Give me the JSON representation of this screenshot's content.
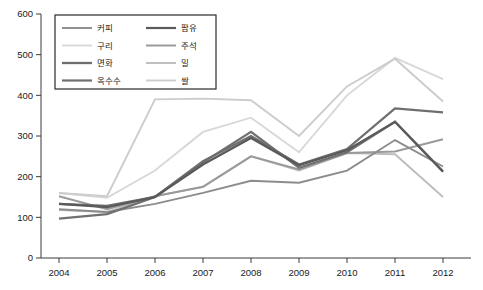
{
  "chart_data": {
    "type": "line",
    "title": "",
    "subtitle": "",
    "xlabel": "",
    "ylabel": "",
    "categories": [
      "2004",
      "2005",
      "2006",
      "2007",
      "2008",
      "2009",
      "2010",
      "2011",
      "2012"
    ],
    "x": [
      2004,
      2005,
      2006,
      2007,
      2008,
      2009,
      2010,
      2011,
      2012
    ],
    "ylim": [
      0,
      600
    ],
    "ytick_values": [
      0,
      100,
      200,
      300,
      400,
      500,
      600
    ],
    "ytick_labels": [
      "0",
      "100",
      "200",
      "300",
      "400",
      "500",
      "600"
    ],
    "xtick_labels": [
      "2004",
      "2005",
      "2006",
      "2007",
      "2008",
      "2009",
      "2010",
      "2011",
      "2012"
    ],
    "grid": false,
    "legend_position": "top-left",
    "series": [
      {
        "name": "커피",
        "color": "#8c8c8c",
        "width": 1.9,
        "values": [
          120,
          113,
          133,
          160,
          190,
          185,
          215,
          290,
          225
        ]
      },
      {
        "name": "구리",
        "color": "#d8d8d8",
        "width": 1.9,
        "values": [
          160,
          148,
          215,
          310,
          345,
          260,
          400,
          492,
          440
        ]
      },
      {
        "name": "면화",
        "color": "#6e6e6e",
        "width": 2.3,
        "values": [
          133,
          128,
          150,
          238,
          300,
          230,
          268,
          368,
          358
        ]
      },
      {
        "name": "옥수수",
        "color": "#707070",
        "width": 2.2,
        "values": [
          97,
          108,
          150,
          235,
          310,
          222,
          260,
          335,
          213
        ]
      },
      {
        "name": "팜유",
        "color": "#5a5a5a",
        "width": 2.2,
        "values": [
          133,
          125,
          150,
          230,
          295,
          228,
          265,
          335,
          212
        ]
      },
      {
        "name": "주석",
        "color": "#9a9a9a",
        "width": 2.0,
        "values": [
          152,
          120,
          152,
          175,
          250,
          218,
          258,
          262,
          292
        ]
      },
      {
        "name": "밀",
        "color": "#bdbdbd",
        "width": 1.9,
        "values": [
          118,
          113,
          152,
          175,
          250,
          215,
          258,
          255,
          150
        ]
      },
      {
        "name": "쌀",
        "color": "#cccccc",
        "width": 1.9,
        "values": [
          160,
          152,
          390,
          392,
          388,
          300,
          422,
          490,
          385
        ]
      }
    ]
  },
  "legend": {
    "entries": [
      {
        "label": "커피"
      },
      {
        "label": "팜유"
      },
      {
        "label": "구리"
      },
      {
        "label": "주석"
      },
      {
        "label": "면화"
      },
      {
        "label": "밀"
      },
      {
        "label": "옥수수"
      },
      {
        "label": "쌀"
      }
    ]
  },
  "axes": {
    "y_labels": [
      "600",
      "500",
      "400",
      "300",
      "200",
      "100",
      "0"
    ],
    "x_labels": [
      "2004",
      "2005",
      "2006",
      "2007",
      "2008",
      "2009",
      "2010",
      "2011",
      "2012"
    ]
  },
  "colors": {
    "axis": "#3a3a3a",
    "background": "#ffffff",
    "legend_border": "#2b2b2b"
  }
}
